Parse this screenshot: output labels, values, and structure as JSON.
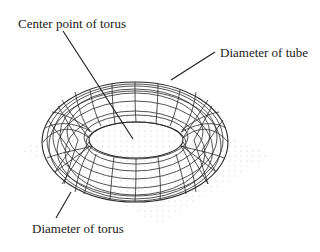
{
  "diagram": {
    "labels": {
      "center_point": "Center point of torus",
      "tube_diameter": "Diameter of tube",
      "torus_diameter": "Diameter of torus"
    },
    "colors": {
      "line": "#1a1a1a",
      "wire": "#2a2a2a",
      "grid_dots": "#b8b8b8",
      "background": "#ffffff"
    }
  }
}
